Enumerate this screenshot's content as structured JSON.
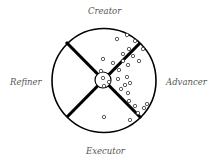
{
  "diagram": {
    "labels": {
      "top": "Creator",
      "left": "Refiner",
      "right": "Advancer",
      "bottom": "Executor"
    },
    "circle": {
      "cx": 104,
      "cy": 80.5,
      "r": 52,
      "stroke": "#000000"
    },
    "hub": {
      "cx": 103,
      "cy": 80,
      "r": 8
    },
    "dividers": [
      {
        "x1": 66,
        "y1": 42,
        "x2": 141,
        "y2": 118
      },
      {
        "x1": 67,
        "y1": 117,
        "x2": 140,
        "y2": 43
      }
    ],
    "dots": [
      [
        117,
        39
      ],
      [
        127,
        35
      ],
      [
        135,
        41
      ],
      [
        143,
        49
      ],
      [
        129,
        49
      ],
      [
        123,
        54
      ],
      [
        133,
        56
      ],
      [
        139,
        61
      ],
      [
        103,
        59
      ],
      [
        113,
        63
      ],
      [
        123,
        61
      ],
      [
        128,
        65
      ],
      [
        119,
        70
      ],
      [
        101,
        71
      ],
      [
        103,
        78
      ],
      [
        109,
        82
      ],
      [
        118,
        79
      ],
      [
        127,
        77
      ],
      [
        130,
        83
      ],
      [
        125,
        85
      ],
      [
        121,
        89
      ],
      [
        104,
        86
      ],
      [
        128,
        93
      ],
      [
        129,
        101
      ],
      [
        135,
        106
      ],
      [
        144,
        108
      ],
      [
        147,
        104
      ],
      [
        138,
        113
      ],
      [
        104,
        117
      ],
      [
        130,
        120
      ]
    ]
  }
}
